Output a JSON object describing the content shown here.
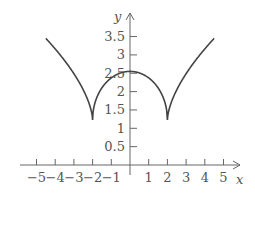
{
  "chart_data": {
    "type": "line",
    "title": "",
    "xlabel": "x",
    "ylabel": "y",
    "xlim": [
      -5.5,
      5.8
    ],
    "ylim": [
      0,
      4
    ],
    "grid": false,
    "legend": null,
    "x_ticks": [
      -5,
      -4,
      -3,
      -2,
      -1,
      1,
      2,
      3,
      4,
      5
    ],
    "x_tick_labels": [
      "−5",
      "−4",
      "−3",
      "−2",
      "−1",
      "1",
      "2",
      "3",
      "4",
      "5"
    ],
    "y_ticks": [
      0.5,
      1,
      1.5,
      2,
      2.5,
      3,
      3.5
    ],
    "y_tick_labels": [
      "0.5",
      "1",
      "1.5",
      "2",
      "2.5",
      "3",
      "3.5"
    ],
    "series": [
      {
        "name": "curve",
        "color": "#444444",
        "x": [
          -4.5,
          -4,
          -3.5,
          -3,
          -2.5,
          -2,
          -1.5,
          -1,
          -0.5,
          0,
          0.5,
          1,
          1.5,
          2,
          2.5,
          3,
          3.5,
          4,
          4.5
        ],
        "y": [
          3.45,
          3.1,
          2.72,
          2.3,
          1.85,
          1.23,
          1.95,
          2.3,
          2.48,
          2.55,
          2.48,
          2.3,
          1.95,
          1.23,
          1.85,
          2.3,
          2.72,
          3.1,
          3.45
        ]
      }
    ],
    "annotations": [
      "cusps at x = -2 and x = 2 (y ≈ 1.2)",
      "local max at x = 0 (y ≈ 2.55)"
    ]
  },
  "colors": {
    "axis": "#666666",
    "curve": "#444444",
    "text": "#555555"
  }
}
